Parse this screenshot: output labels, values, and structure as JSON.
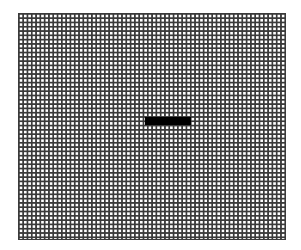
{
  "canvas": {
    "background": "#ffffff"
  },
  "grid": {
    "line_color": "#3a3a3a",
    "cell_pitch_px": 4.3,
    "columns": 62,
    "rows": 52
  },
  "marker": {
    "shape": "horizontal-bar",
    "color": "#000000",
    "left": 145,
    "top": 117,
    "width": 46,
    "height": 8
  }
}
